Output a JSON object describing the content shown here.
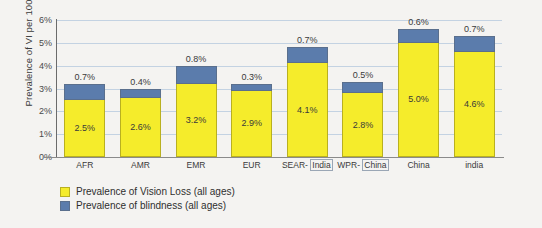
{
  "chart_data": {
    "type": "bar",
    "stacked": true,
    "title": "",
    "xlabel": "",
    "ylabel": "Prevalence of VI per 100 pop",
    "ylim": [
      0,
      6
    ],
    "ytick_labels": [
      "0%",
      "1%",
      "2%",
      "3%",
      "4%",
      "5%",
      "6%"
    ],
    "ytick_values": [
      0,
      1,
      2,
      3,
      4,
      5,
      6
    ],
    "grid": true,
    "legend_position": "bottom-left",
    "categories": [
      "AFR",
      "AMR",
      "EMR",
      "EUR",
      "SEAR- India",
      "WPR- China",
      "China",
      "india"
    ],
    "category_parts": [
      {
        "main": "AFR",
        "boxed": ""
      },
      {
        "main": "AMR",
        "boxed": ""
      },
      {
        "main": "EMR",
        "boxed": ""
      },
      {
        "main": "EUR",
        "boxed": ""
      },
      {
        "main": "SEAR-",
        "boxed": "India"
      },
      {
        "main": "WPR-",
        "boxed": "China"
      },
      {
        "main": "China",
        "boxed": ""
      },
      {
        "main": "india",
        "boxed": ""
      }
    ],
    "series": [
      {
        "name": "Prevalence of Vision Loss (all ages)",
        "color": "#f5ec2b",
        "values": [
          2.5,
          2.6,
          3.2,
          2.9,
          4.1,
          2.8,
          5.0,
          4.6
        ],
        "labels": [
          "2.5%",
          "2.6%",
          "3.2%",
          "2.9%",
          "4.1%",
          "2.8%",
          "5.0%",
          "4.6%"
        ]
      },
      {
        "name": "Prevalence of blindness (all ages)",
        "color": "#5b7cac",
        "values": [
          0.7,
          0.4,
          0.8,
          0.3,
          0.7,
          0.5,
          0.6,
          0.7
        ],
        "labels": [
          "0.7%",
          "0.4%",
          "0.8%",
          "0.3%",
          "0.7%",
          "0.5%",
          "0.6%",
          "0.7%"
        ]
      }
    ]
  },
  "legend": {
    "items": [
      {
        "label": "Prevalence of Vision Loss (all ages)",
        "color": "#f5ec2b"
      },
      {
        "label": "Prevalence of blindness (all ages)",
        "color": "#5b7cac"
      }
    ]
  }
}
